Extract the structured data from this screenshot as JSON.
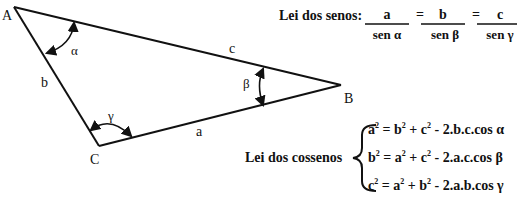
{
  "triangle": {
    "vertices": {
      "A": {
        "label": "A",
        "x": 14,
        "y": 7
      },
      "B": {
        "label": "B",
        "x": 341,
        "y": 85
      },
      "C": {
        "label": "C",
        "x": 99,
        "y": 146
      }
    },
    "sides": {
      "a": "a",
      "b": "b",
      "c": "c"
    },
    "angles": {
      "alpha": "α",
      "beta": "β",
      "gamma": "γ"
    },
    "line_color": "#111111"
  },
  "law_of_sines": {
    "title": "Lei dos senos:",
    "fractions": [
      {
        "numerator": "a",
        "denominator": "sen α"
      },
      {
        "numerator": "b",
        "denominator": "sen β"
      },
      {
        "numerator": "c",
        "denominator": "sen γ"
      }
    ],
    "equals": "="
  },
  "law_of_cosines": {
    "title": "Lei dos cossenos",
    "equations": [
      {
        "lhs": "a",
        "rhs_1": "b",
        "rhs_2": "c",
        "tail": " - 2.b.c.cos α"
      },
      {
        "lhs": "b",
        "rhs_1": "a",
        "rhs_2": "c",
        "tail": " - 2.a.c.cos β"
      },
      {
        "lhs": "c",
        "rhs_1": "a",
        "rhs_2": "b",
        "tail": " - 2.a.b.cos γ"
      }
    ],
    "exponent": "2",
    "equals": " = ",
    "plus": " + "
  }
}
